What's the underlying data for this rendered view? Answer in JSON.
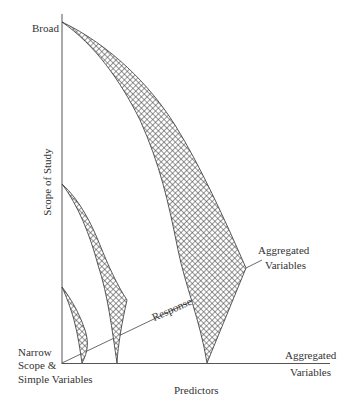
{
  "diagram": {
    "y_axis": {
      "label": "Scope of Study",
      "top_label": "Broad",
      "bottom_label_lines": [
        "Narrow",
        "Scope &",
        "Simple Variables"
      ]
    },
    "x_axis": {
      "label": "Predictors",
      "right_label_lines": [
        "Aggregated",
        "Variables"
      ]
    },
    "annotations": {
      "response": "Response",
      "aggregated_lines": [
        "Aggregated",
        "Variables"
      ]
    },
    "colors": {
      "line": "#3a3a3a",
      "hatch": "#444444",
      "background": "#ffffff"
    }
  }
}
